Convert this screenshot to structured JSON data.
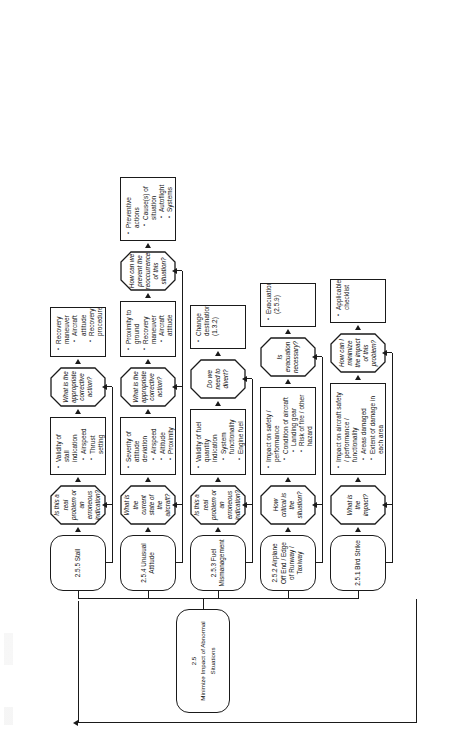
{
  "diagram": {
    "root": {
      "number": "2.5",
      "label": "Minimize Impact of Abnormal Situations"
    },
    "orientation": "rotated-90-ccw",
    "branches": [
      {
        "id": "2.5.1",
        "head": "2.5.1 Bird Strike",
        "steps": [
          {
            "kind": "decision",
            "label": "What is the impact?"
          },
          {
            "kind": "process",
            "label": "Impact on aircraft safety / performance / functionality",
            "items": [
              {
                "text": "Areas damaged"
              },
              {
                "text": "Extent of damage in each area"
              },
              {
                "text": "Effect on propulsion system",
                "sub": [
                  "Thrust level",
                  "Airspeed decay"
                ]
              },
              {
                "text": "Effect on flight control systems",
                "sub": [
                  "Attitude",
                  "Control feel"
                ]
              }
            ]
          },
          {
            "kind": "decision",
            "label": "How can I minimize the impact of this problem?"
          },
          {
            "kind": "process",
            "label": "",
            "items": [
              {
                "text": "Applicable checklist"
              }
            ]
          }
        ]
      },
      {
        "id": "2.5.2",
        "head": "2.5.2 Airplane Off End / Edge of Runway / Taxiway",
        "steps": [
          {
            "kind": "decision",
            "label": "How critical is the situation?"
          },
          {
            "kind": "process",
            "label": "Impact on safety / performance",
            "items": [
              {
                "text": "Condition of aircraft",
                "sub": [
                  "Landing gear",
                  "Risk of fire / other hazard"
                ]
              },
              {
                "text": "Condition of passengers",
                "sub": [
                  "Injuries",
                  "Emergencies"
                ]
              }
            ]
          },
          {
            "kind": "decision",
            "label": "Is evacuation necessary?"
          },
          {
            "kind": "process",
            "label": "",
            "items": [
              {
                "text": "Evacuation (2.5.9)"
              }
            ]
          }
        ]
      },
      {
        "id": "2.5.3",
        "head": "2.5.3 Fuel Mismanagement",
        "steps": [
          {
            "kind": "decision",
            "label": "Is this a real problem or an erroneous indication?"
          },
          {
            "kind": "process",
            "label": "Validity of fuel quantity indication",
            "items": [
              {
                "text": "System functionality"
              },
              {
                "text": "Engine fuel flow/fuel used history"
              }
            ]
          },
          {
            "kind": "decision",
            "label": "Do we need to divert?"
          },
          {
            "kind": "process",
            "label": "",
            "items": [
              {
                "text": "Change destination (1.3.2)"
              }
            ]
          }
        ]
      },
      {
        "id": "2.5.4",
        "head": "2.5.4 Unusual Attitude",
        "steps": [
          {
            "kind": "decision",
            "label": "What is the current state of the aircraft?"
          },
          {
            "kind": "process",
            "label": "Severity of attitude deviation",
            "items": [
              {
                "text": "Airspeed"
              },
              {
                "text": "Altitude"
              },
              {
                "text": "Proximity to ground"
              }
            ]
          },
          {
            "kind": "decision",
            "label": "What is the appropriate corrective action?"
          },
          {
            "kind": "process",
            "label": "",
            "items": [
              {
                "text": "Proximity to ground"
              },
              {
                "text": "Recovery maneuver",
                "sub": [
                  "Aircraft attitude",
                  "Recovery procedure"
                ]
              }
            ]
          },
          {
            "kind": "decision",
            "label": "How can we prevent the reoccurrence of this situation?"
          },
          {
            "kind": "process",
            "label": "Preventive actions",
            "items": [
              {
                "text": "Cause(s) of situation",
                "sub": [
                  "Autoflight",
                  "Systems status",
                  "Crew error"
                ]
              }
            ]
          }
        ]
      },
      {
        "id": "2.5.5",
        "head": "2.5.5 Stall",
        "steps": [
          {
            "kind": "decision",
            "label": "Is this a real problem or an erroneous indication?"
          },
          {
            "kind": "process",
            "label": "Validity of stall indication",
            "items": [
              {
                "text": "Airspeed"
              },
              {
                "text": "Thrust setting"
              },
              {
                "text": "Aircraft attitude"
              }
            ]
          },
          {
            "kind": "decision",
            "label": "What is the appropriate corrective action?"
          },
          {
            "kind": "process",
            "label": "",
            "items": [
              {
                "text": "Recovery maneuver",
                "sub": [
                  "Aircraft attitude",
                  "Recovery procedure"
                ]
              }
            ]
          }
        ]
      }
    ]
  },
  "colors": {
    "ink": "#1a1a1a",
    "paper": "#ffffff"
  }
}
